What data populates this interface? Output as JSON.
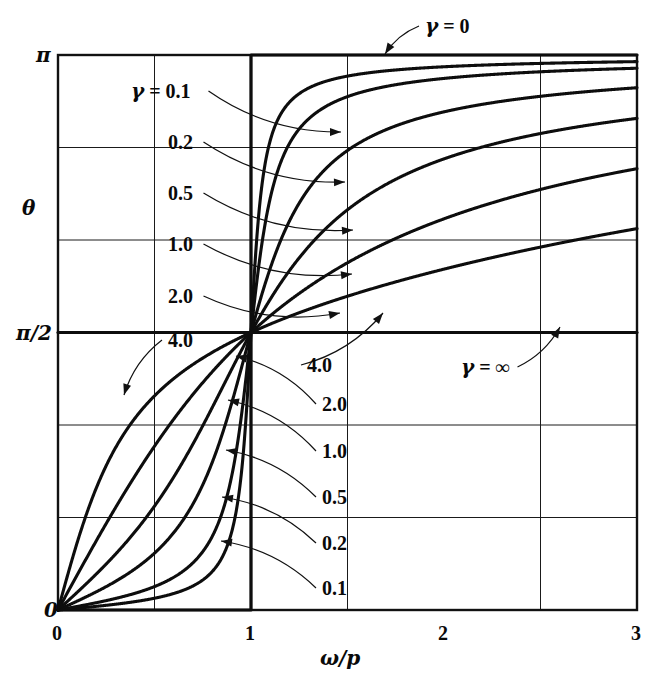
{
  "figure": {
    "y_axis_label": "θ",
    "x_axis_label": "ω/p",
    "y_ticks": [
      {
        "value": 3.14159265,
        "label": "π"
      },
      {
        "value": 1.57079633,
        "label": "π/2"
      },
      {
        "value": 0,
        "label": "0"
      }
    ],
    "x_ticks": [
      {
        "value": 0,
        "label": "0"
      },
      {
        "value": 1,
        "label": "1"
      },
      {
        "value": 2,
        "label": "2"
      },
      {
        "value": 3,
        "label": "3"
      }
    ],
    "gridlines": {
      "x_minor": [
        0.5,
        1.5,
        2.5
      ],
      "x_major": [
        1
      ],
      "y_minor": [
        0.52359878,
        1.04719755,
        2.0943951,
        2.61799388
      ],
      "y_major": [
        1.57079633
      ],
      "grid": "on"
    },
    "annotations": [
      {
        "name": "gamma-zero",
        "text": "γ = 0",
        "x": 425,
        "y": 16,
        "arrow_to_x": 385,
        "arrow_to_y": 54
      },
      {
        "name": "gamma-0p1-top",
        "text": "γ = 0.1",
        "x": 131,
        "y": 81,
        "arrow_to_x": 341,
        "arrow_to_y": 132
      },
      {
        "name": "gamma-0p2-top",
        "text": "0.2",
        "x": 168,
        "y": 132,
        "arrow_to_x": 345,
        "arrow_to_y": 182
      },
      {
        "name": "gamma-0p5-top",
        "text": "0.5",
        "x": 168,
        "y": 183,
        "arrow_to_x": 353,
        "arrow_to_y": 230
      },
      {
        "name": "gamma-1p0-top",
        "text": "1.0",
        "x": 168,
        "y": 234,
        "arrow_to_x": 352,
        "arrow_to_y": 274
      },
      {
        "name": "gamma-2p0-top",
        "text": "2.0",
        "x": 168,
        "y": 286,
        "arrow_to_x": 340,
        "arrow_to_y": 313
      },
      {
        "name": "gamma-4p0-top",
        "text": "4.0",
        "x": 168,
        "y": 330,
        "arrow_to_x": 124,
        "arrow_to_y": 395
      },
      {
        "name": "gamma-4p0-right",
        "text": "4.0",
        "x": 307,
        "y": 355,
        "arrow_to_x": 383,
        "arrow_to_y": 313
      },
      {
        "name": "gamma-infinity",
        "text": "γ = ∞",
        "x": 461,
        "y": 357,
        "arrow_to_x": 560,
        "arrow_to_y": 327
      },
      {
        "name": "gamma-2p0-bottom",
        "text": "2.0",
        "x": 322,
        "y": 394,
        "arrow_to_x": 236,
        "arrow_to_y": 356
      },
      {
        "name": "gamma-1p0-bottom",
        "text": "1.0",
        "x": 322,
        "y": 441,
        "arrow_to_x": 228,
        "arrow_to_y": 400
      },
      {
        "name": "gamma-0p5-bottom",
        "text": "0.5",
        "x": 322,
        "y": 487,
        "arrow_to_x": 226,
        "arrow_to_y": 450
      },
      {
        "name": "gamma-0p2-bottom",
        "text": "0.2",
        "x": 322,
        "y": 533,
        "arrow_to_x": 222,
        "arrow_to_y": 497
      },
      {
        "name": "gamma-0p1-bottom",
        "text": "0.1",
        "x": 322,
        "y": 578,
        "arrow_to_x": 221,
        "arrow_to_y": 541
      }
    ]
  },
  "chart_data": {
    "type": "line",
    "title": "",
    "xlabel": "ω/p",
    "ylabel": "θ",
    "xlim": [
      0,
      3
    ],
    "ylim": [
      0,
      3.14159265
    ],
    "grid": "on",
    "legend_position": "inline-annotations",
    "x_tick_labels": [
      "0",
      "1",
      "2",
      "3"
    ],
    "y_tick_labels": [
      "0",
      "π/2",
      "π"
    ],
    "formula": "theta = arctan( gamma * r / (1 - r^2) ),  r = omega/p",
    "series": [
      {
        "name": "γ = 0",
        "gamma": 0,
        "x": [
          0,
          0.999,
          1.0,
          1.001,
          1.5,
          2,
          2.5,
          3
        ],
        "values": [
          0,
          0,
          1.5708,
          3.14159,
          3.14159,
          3.14159,
          3.14159,
          3.14159
        ]
      },
      {
        "name": "γ = 0.1",
        "gamma": 0.1,
        "x": [
          0,
          0.25,
          0.5,
          0.75,
          0.9,
          1.0,
          1.1,
          1.25,
          1.5,
          2,
          2.5,
          3
        ],
        "values": [
          0,
          0.0267,
          0.0665,
          0.1679,
          0.3875,
          1.5708,
          2.7855,
          2.9437,
          3.0018,
          3.0748,
          3.1005,
          3.1123
        ]
      },
      {
        "name": "γ = 0.2",
        "gamma": 0.2,
        "x": [
          0,
          0.25,
          0.5,
          0.75,
          0.9,
          1.0,
          1.1,
          1.25,
          1.5,
          2,
          2.5,
          3
        ],
        "values": [
          0,
          0.0533,
          0.1325,
          0.3277,
          0.6917,
          1.5708,
          2.4607,
          2.8071,
          2.9399,
          3.0418,
          3.0828,
          3.1019
        ]
      },
      {
        "name": "γ = 0.5",
        "gamma": 0.5,
        "x": [
          0,
          0.25,
          0.5,
          0.75,
          0.9,
          1.0,
          1.1,
          1.25,
          1.5,
          2,
          2.5,
          3
        ],
        "values": [
          0,
          0.1325,
          0.3217,
          0.7137,
          1.1659,
          1.5708,
          1.936,
          2.2056,
          2.5536,
          2.8198,
          2.9443,
          3.005
        ]
      },
      {
        "name": "γ = 1.0",
        "gamma": 1.0,
        "x": [
          0,
          0.25,
          0.5,
          0.75,
          0.9,
          1.0,
          1.1,
          1.25,
          1.5,
          2,
          2.5,
          3
        ],
        "values": [
          0,
          0.2622,
          0.588,
          1.0512,
          1.3614,
          1.5708,
          1.7652,
          1.9943,
          2.2606,
          2.618,
          2.8214,
          2.9208
        ]
      },
      {
        "name": "γ = 2.0",
        "gamma": 2.0,
        "x": [
          0,
          0.25,
          0.5,
          0.75,
          0.9,
          1.0,
          1.1,
          1.25,
          1.5,
          2,
          2.5,
          3
        ],
        "values": [
          0,
          0.49,
          0.9273,
          1.2793,
          1.4452,
          1.5708,
          1.6964,
          1.8663,
          2.1112,
          2.5536,
          2.73,
          2.8105
        ]
      },
      {
        "name": "γ = 4.0",
        "gamma": 4.0,
        "x": [
          0,
          0.25,
          0.5,
          0.75,
          0.9,
          1.0,
          1.1,
          1.25,
          1.5,
          2,
          2.5,
          3
        ],
        "values": [
          0,
          0.8157,
          1.212,
          1.3986,
          1.4837,
          1.5708,
          1.6513,
          1.7571,
          1.9268,
          2.2143,
          2.4205,
          2.5536
        ]
      },
      {
        "name": "γ = ∞",
        "gamma": null,
        "x": [
          0,
          0.5,
          1,
          1.5,
          2,
          2.5,
          3
        ],
        "values": [
          1.5708,
          1.5708,
          1.5708,
          1.5708,
          1.5708,
          1.5708,
          1.5708
        ]
      }
    ]
  }
}
